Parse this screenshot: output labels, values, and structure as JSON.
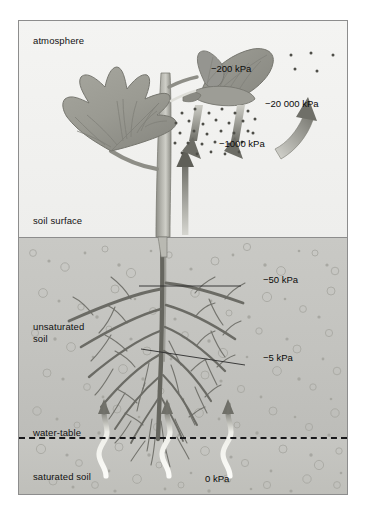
{
  "diagram": {
    "type": "scientific-illustration"
  },
  "zones": {
    "atmosphere_label": "atmosphere",
    "soil_surface_label": "soil surface",
    "unsaturated_label": "unsaturated\nsoil",
    "water_table_label": "water-table",
    "saturated_label": "saturated soil"
  },
  "potentials": {
    "leaf": "−200 kPa",
    "air": "−20 000 kPa",
    "vapour": "−1000 kPa",
    "upper_root": "−50 kPa",
    "lower_root": "−5 kPa",
    "water_table": "0 kPa"
  },
  "colors": {
    "atmosphere_bg": "#f2f2f0",
    "unsaturated_soil_bg": "#c6c6c2",
    "saturated_soil_bg": "#c2c2be",
    "plant_green": "#9a9a93",
    "plant_dark": "#7b7b74",
    "root_dark": "#6e6e68",
    "arrow_dark": "#76766f",
    "arrow_light": "#d8d8d2",
    "frame_border": "#8d8d8d",
    "water_table_line": "#17171a",
    "text": "#111111"
  },
  "elements": {
    "leaf_left": "large lobed leaf on left stem",
    "leaf_upper_right": "upper leaf pair at apex",
    "stem": "central vertical stem",
    "xylem_arrow": "upward flow arrow in stem",
    "transpiration_arrows": "two downward vapour arrows below leaf",
    "vapour_dots": "water vapour particles",
    "air_arrow": "large curved arrow to atmosphere",
    "root_system": "taproot with lateral branches",
    "capillary_flows": "three wavy upward water flows from water table"
  }
}
